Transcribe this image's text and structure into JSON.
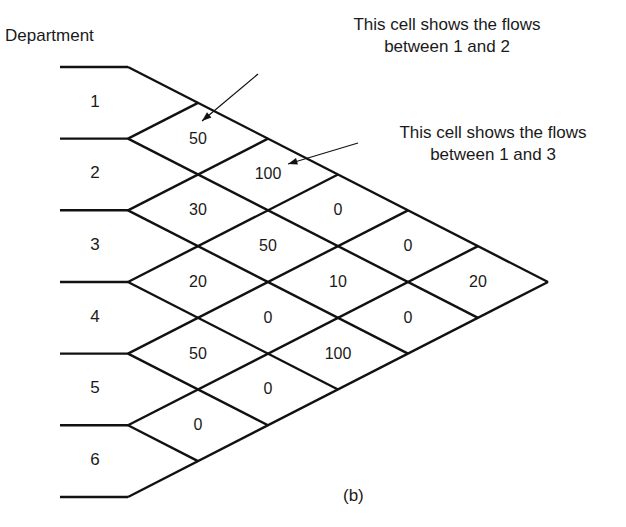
{
  "title": "Department",
  "caption": "(b)",
  "departments": [
    "1",
    "2",
    "3",
    "4",
    "5",
    "6"
  ],
  "annotations": [
    {
      "line1": "This cell shows the flows",
      "line2": "between 1 and 2"
    },
    {
      "line1": "This cell shows the flows",
      "line2": "between 1 and 3"
    }
  ],
  "flows": [
    {
      "from": 1,
      "to": 2,
      "value": "50"
    },
    {
      "from": 1,
      "to": 3,
      "value": "100"
    },
    {
      "from": 1,
      "to": 4,
      "value": "0"
    },
    {
      "from": 1,
      "to": 5,
      "value": "0"
    },
    {
      "from": 1,
      "to": 6,
      "value": "20"
    },
    {
      "from": 2,
      "to": 3,
      "value": "30"
    },
    {
      "from": 2,
      "to": 4,
      "value": "50"
    },
    {
      "from": 2,
      "to": 5,
      "value": "10"
    },
    {
      "from": 2,
      "to": 6,
      "value": "0"
    },
    {
      "from": 3,
      "to": 4,
      "value": "20"
    },
    {
      "from": 3,
      "to": 5,
      "value": "0"
    },
    {
      "from": 3,
      "to": 6,
      "value": "100"
    },
    {
      "from": 4,
      "to": 5,
      "value": "50"
    },
    {
      "from": 4,
      "to": 6,
      "value": "0"
    },
    {
      "from": 5,
      "to": 6,
      "value": "0"
    }
  ],
  "colors": {
    "line": "#111111",
    "text": "#1a1a1a"
  }
}
